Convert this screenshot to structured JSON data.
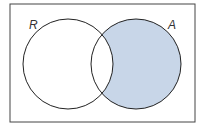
{
  "diagram": {
    "type": "venn",
    "universe": {
      "x": 10,
      "y": 4,
      "width": 185,
      "height": 118,
      "stroke": "#444444"
    },
    "sets": [
      {
        "label": "R",
        "cx": 68,
        "cy": 64,
        "r": 45,
        "label_x": 29,
        "label_y": 29
      },
      {
        "label": "A",
        "cx": 136,
        "cy": 64,
        "r": 45,
        "label_x": 168,
        "label_y": 29
      }
    ],
    "shaded_region": "A minus R",
    "shade_color": "#c8d6e8",
    "stroke_color": "#222222"
  }
}
